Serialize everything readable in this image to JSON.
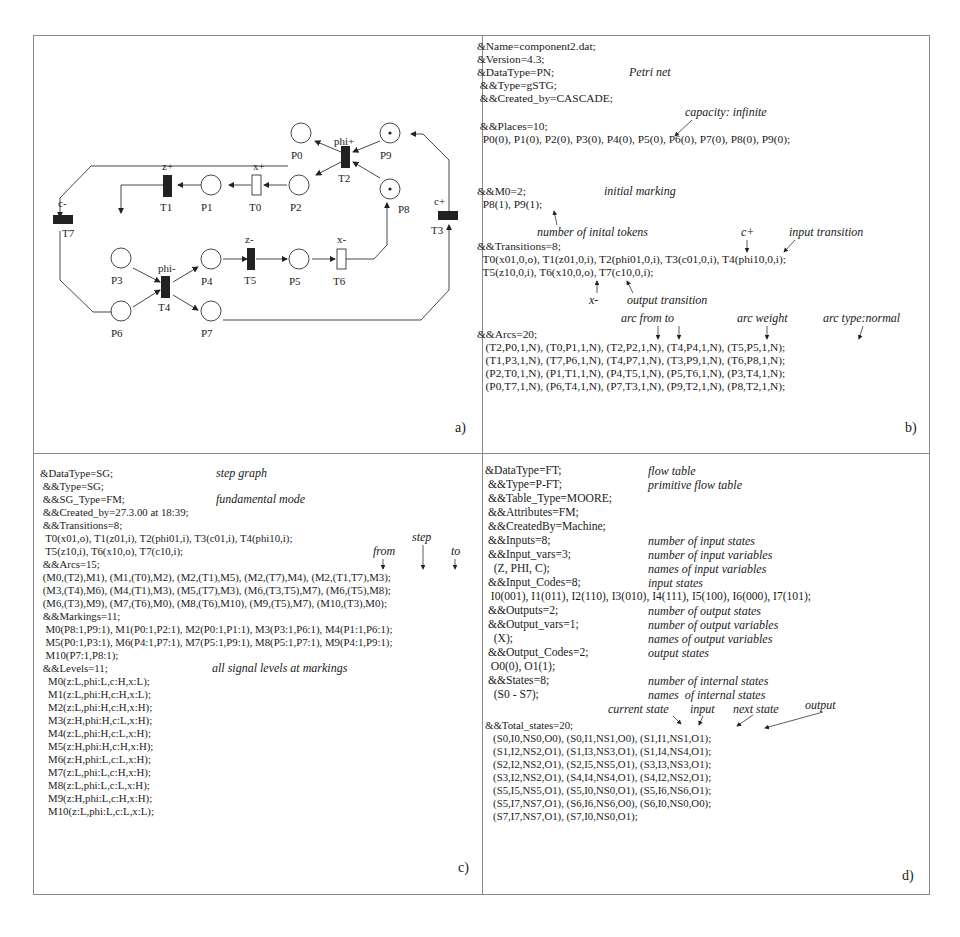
{
  "panel_a": {
    "label": "a)",
    "places": [
      {
        "id": "P0",
        "x": 405,
        "y": 95,
        "tokens": 0
      },
      {
        "id": "P1",
        "x": 213,
        "y": 187,
        "tokens": 0
      },
      {
        "id": "P2",
        "x": 301,
        "y": 187,
        "tokens": 0
      },
      {
        "id": "P3",
        "x": 124,
        "y": 247,
        "tokens": 0
      },
      {
        "id": "P4",
        "x": 213,
        "y": 247,
        "tokens": 0
      },
      {
        "id": "P5",
        "x": 301,
        "y": 247,
        "tokens": 0
      },
      {
        "id": "P6",
        "x": 124,
        "y": 312,
        "tokens": 0
      },
      {
        "id": "P7",
        "x": 213,
        "y": 312,
        "tokens": 0
      },
      {
        "id": "P8",
        "x": 392,
        "y": 187,
        "tokens": 1
      },
      {
        "id": "P9",
        "x": 392,
        "y": 95,
        "tokens": 1
      }
    ],
    "transitions": [
      {
        "id": "T0",
        "signal": "x+",
        "kind": "output"
      },
      {
        "id": "T1",
        "signal": "z+",
        "kind": "input"
      },
      {
        "id": "T2",
        "signal": "phi+",
        "kind": "input"
      },
      {
        "id": "T3",
        "signal": "c+",
        "kind": "input"
      },
      {
        "id": "T4",
        "signal": "phi-",
        "kind": "input"
      },
      {
        "id": "T5",
        "signal": "z-",
        "kind": "input"
      },
      {
        "id": "T6",
        "signal": "x-",
        "kind": "output"
      },
      {
        "id": "T7",
        "signal": "c-",
        "kind": "input"
      }
    ]
  },
  "panel_b": {
    "label": "b)",
    "lines": [
      "&Name=component2.dat;",
      "&Version=4.3;",
      "&DataType=PN;",
      " &&Type=gSTG;",
      " &&Created_by=CASCADE;",
      "",
      " &&Places=10;",
      "  P0(0), P1(0), P2(0), P3(0), P4(0), P5(0), P6(0), P7(0), P8(0), P9(0);",
      "",
      "",
      "&&M0=2;",
      "  P8(1), P9(1);",
      "",
      "",
      "&&Transitions=8;",
      "  T0(x01,0,o), T1(z01,0,i), T2(phi01,0,i), T3(c01,0,i), T4(phi10,0,i);",
      "  T5(z10,0,i), T6(x10,0,o), T7(c10,0,i);",
      "",
      "",
      "",
      "&&Arcs=20;",
      "   (T2,P0,1,N), (T0,P1,1,N), (T2,P2,1,N), (T4,P4,1,N), (T5,P5,1,N);",
      "   (T1,P3,1,N), (T7,P6,1,N), (T4,P7,1,N), (T3,P9,1,N), (T6,P8,1,N);",
      "   (P2,T0,1,N), (P1,T1,1,N), (P4,T5,1,N), (P5,T6,1,N), (P3,T4,1,N);",
      "   (P0,T7,1,N), (P6,T4,1,N), (P7,T3,1,N), (P9,T2,1,N), (P8,T2,1,N);"
    ],
    "notes": {
      "petri_net": "Petri net",
      "capacity": "capacity: infinite",
      "initial_marking": "initial marking",
      "initial_tokens": "number of inital tokens",
      "c_plus": "c+",
      "input_transition": "input transition",
      "x_minus": "x-",
      "output_transition": "output transition",
      "arc_from_to": "arc from to",
      "arc_weight": "arc weight",
      "arc_type": "arc type:normal"
    }
  },
  "panel_c": {
    "label": "c)",
    "lines": [
      "&DataType=SG;",
      " &&Type=SG;",
      " &&SG_Type=FM;",
      " &&Created_by=27.3.00 at 18:39;",
      " &&Transitions=8;",
      "  T0(x01,o), T1(z01,i), T2(phi01,i), T3(c01,i), T4(phi10,i);",
      "  T5(z10,i), T6(x10,o), T7(c10,i);",
      " &&Arcs=15;",
      " (M0,(T2),M1), (M1,(T0),M2), (M2,(T1),M5), (M2,(T7),M4), (M2,(T1,T7),M3);",
      " (M3,(T4),M6), (M4,(T1),M3), (M5,(T7),M3), (M6,(T3,T5),M7), (M6,(T5),M8);",
      " (M6,(T3),M9), (M7,(T6),M0), (M8,(T6),M10), (M9,(T5),M7), (M10,(T3),M0);",
      " &&Markings=11;",
      "  M0(P8:1,P9:1), M1(P0:1,P2:1), M2(P0:1,P1:1), M3(P3:1,P6:1), M4(P1:1,P6:1);",
      "  M5(P0:1,P3:1), M6(P4:1,P7:1), M7(P5:1,P9:1), M8(P5:1,P7:1), M9(P4:1,P9:1);",
      "  M10(P7:1,P8:1);",
      " &&Levels=11;",
      "   M0(z:L,phi:L,c:H,x:L);",
      "   M1(z:L,phi:H,c:H,x:L);",
      "   M2(z:L,phi:H,c:H,x:H);",
      "   M3(z:H,phi:H,c:L,x:H);",
      "   M4(z:L,phi:H,c:L,x:H);",
      "   M5(z:H,phi:H,c:H,x:H);",
      "   M6(z:H,phi:L,c:L,x:H);",
      "   M7(z:L,phi:L,c:H,x:H);",
      "   M8(z:L,phi:L,c:L,x:H);",
      "   M9(z:H,phi:L,c:H,x:H);",
      "   M10(z:L,phi:L,c:L,x:L);"
    ],
    "notes": {
      "step_graph": "step graph",
      "fundamental_mode": "fundamental mode",
      "step": "step",
      "from": "from",
      "to": "to",
      "levels": "all signal levels at markings"
    }
  },
  "panel_d": {
    "label": "d)",
    "lines": [
      "&DataType=FT;",
      " &&Type=P-FT;",
      " &&Table_Type=MOORE;",
      " &&Attributes=FM;",
      " &&CreatedBy=Machine;",
      " &&Inputs=8;",
      " &&Input_vars=3;",
      "   (Z, PHI, C);",
      " &&Input_Codes=8;",
      "  I0(001), I1(011), I2(110), I3(010), I4(111), I5(100), I6(000), I7(101);",
      " &&Outputs=2;",
      " &&Output_vars=1;",
      "   (X);",
      " &&Output_Codes=2;",
      "  O0(0), O1(1);",
      " &&States=8;",
      "   (S0 - S7);",
      "",
      "&&Total_states=20;",
      "   (S0,I0,NS0,O0), (S0,I1,NS1,O0), (S1,I1,NS1,O1);",
      "   (S1,I2,NS2,O1), (S1,I3,NS3,O1), (S1,I4,NS4,O1);",
      "   (S2,I2,NS2,O1), (S2,I5,NS5,O1), (S3,I3,NS3,O1);",
      "   (S3,I2,NS2,O1), (S4,I4,NS4,O1), (S4,I2,NS2,O1);",
      "   (S5,I5,NS5,O1), (S5,I0,NS0,O1), (S5,I6,NS6,O1);",
      "   (S5,I7,NS7,O1), (S6,I6,NS6,O0), (S6,I0,NS0,O0);",
      "   (S7,I7,NS7,O1), (S7,I0,NS0,O1);"
    ],
    "notes": {
      "flow_table": "flow table",
      "primitive": "primitive flow table",
      "n_input_states": "number of input states",
      "n_input_vars": "number of input variables",
      "input_var_names": "names of input variables",
      "input_states": "input states",
      "n_output_states": "number of output states",
      "n_output_vars": "number of output variables",
      "output_var_names": "names of output variables",
      "output_states": "output states",
      "n_internal": "number of internal states",
      "internal_names": "names  of internal states",
      "current_state": "current state",
      "input": "input",
      "next_state": "next state",
      "output": "output"
    }
  }
}
